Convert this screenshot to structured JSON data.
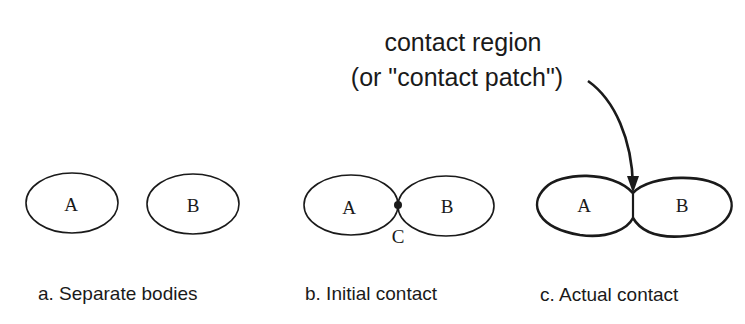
{
  "annotation": {
    "line1": "contact region",
    "line2": "(or \"contact patch\")"
  },
  "panels": [
    {
      "id": "a",
      "caption": "a.  Separate bodies",
      "body_a_label": "A",
      "body_b_label": "B"
    },
    {
      "id": "b",
      "caption": "b.  Initial contact",
      "body_a_label": "A",
      "body_b_label": "B",
      "contact_point_label": "C"
    },
    {
      "id": "c",
      "caption": "c.  Actual contact",
      "body_a_label": "A",
      "body_b_label": "B"
    }
  ],
  "colors": {
    "stroke": "#1a1a1a",
    "background": "#ffffff"
  }
}
